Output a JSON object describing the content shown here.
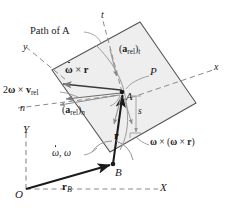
{
  "figure": {
    "colors": {
      "ink": "#1a1a1a",
      "plate_fill": "#eeeeee",
      "plate_stroke": "#555555",
      "thin_vector": "#808080",
      "dashed_axis": "#8a8a8a"
    }
  },
  "labels": {
    "path_of_a": "Path of A",
    "t_axis": "t",
    "n_axis": "n",
    "y_axis": "y",
    "x_axis": "x",
    "X_axis": "X",
    "Y_axis": "Y",
    "origin": "O",
    "point_a": "A",
    "point_b": "B",
    "point_p": "P",
    "arc_length": "s",
    "a_rel_t": {
      "base": "a",
      "sub": "rel",
      "comp": "t"
    },
    "a_rel_n": {
      "base": "a",
      "sub": "rel",
      "comp": "n"
    },
    "coriolis": {
      "coef": "2",
      "omega": "ω",
      "cross": "×",
      "v": "v",
      "vsub": "rel"
    },
    "alpha_cross_r": {
      "omega": "ω",
      "cross": "×",
      "r": "r"
    },
    "centripetal": {
      "omega": "ω",
      "cross": "×",
      "r": "r"
    },
    "omega_pair": {
      "dotted": "ω",
      "plain": "ω",
      "sep": ", "
    },
    "r_vector": "r",
    "r_b_vector": {
      "base": "r",
      "sub": "B"
    }
  },
  "geometry": {
    "point_a": [
      122,
      92
    ],
    "point_b": [
      113,
      164
    ],
    "origin": [
      26,
      189
    ],
    "plate_corners": [
      [
        52,
        70
      ],
      [
        140,
        22
      ],
      [
        196,
        103
      ],
      [
        110,
        152
      ]
    ]
  }
}
